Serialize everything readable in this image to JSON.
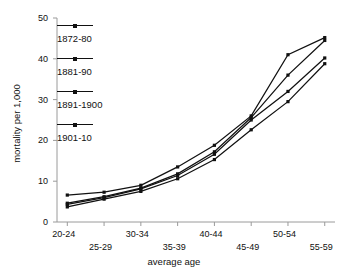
{
  "chart_data": {
    "type": "line",
    "title": "",
    "xlabel": "average age",
    "ylabel": "mortality per 1,000",
    "categories": [
      "20-24",
      "25-29",
      "30-34",
      "35-39",
      "40-44",
      "45-49",
      "50-54",
      "55-59"
    ],
    "ylim": [
      0,
      50
    ],
    "yticks": [
      "0",
      "10",
      "20",
      "30",
      "40",
      "50"
    ],
    "ytick_values": [
      0,
      10,
      20,
      30,
      40,
      50
    ],
    "grid": false,
    "legend_position": "upper-left-inside",
    "series": [
      {
        "name": "1872-80",
        "values": [
          6.6,
          7.3,
          9.0,
          13.5,
          18.8,
          26.0,
          41.0,
          45.2
        ]
      },
      {
        "name": "1881-90",
        "values": [
          4.6,
          6.2,
          8.3,
          11.8,
          17.2,
          25.6,
          36.0,
          44.5
        ]
      },
      {
        "name": "1891-1900",
        "values": [
          4.3,
          6.0,
          8.1,
          11.4,
          16.6,
          25.0,
          32.0,
          40.2
        ]
      },
      {
        "name": "1901-10",
        "values": [
          3.7,
          5.6,
          7.5,
          10.6,
          15.3,
          22.6,
          29.5,
          38.8
        ]
      }
    ]
  },
  "axis": {
    "x_title": "average age",
    "y_title": "mortality per 1,000"
  },
  "legend": {
    "items": [
      {
        "label": "1872-80"
      },
      {
        "label": "1881-90"
      },
      {
        "label": "1891-1900"
      },
      {
        "label": "1901-10"
      }
    ]
  }
}
